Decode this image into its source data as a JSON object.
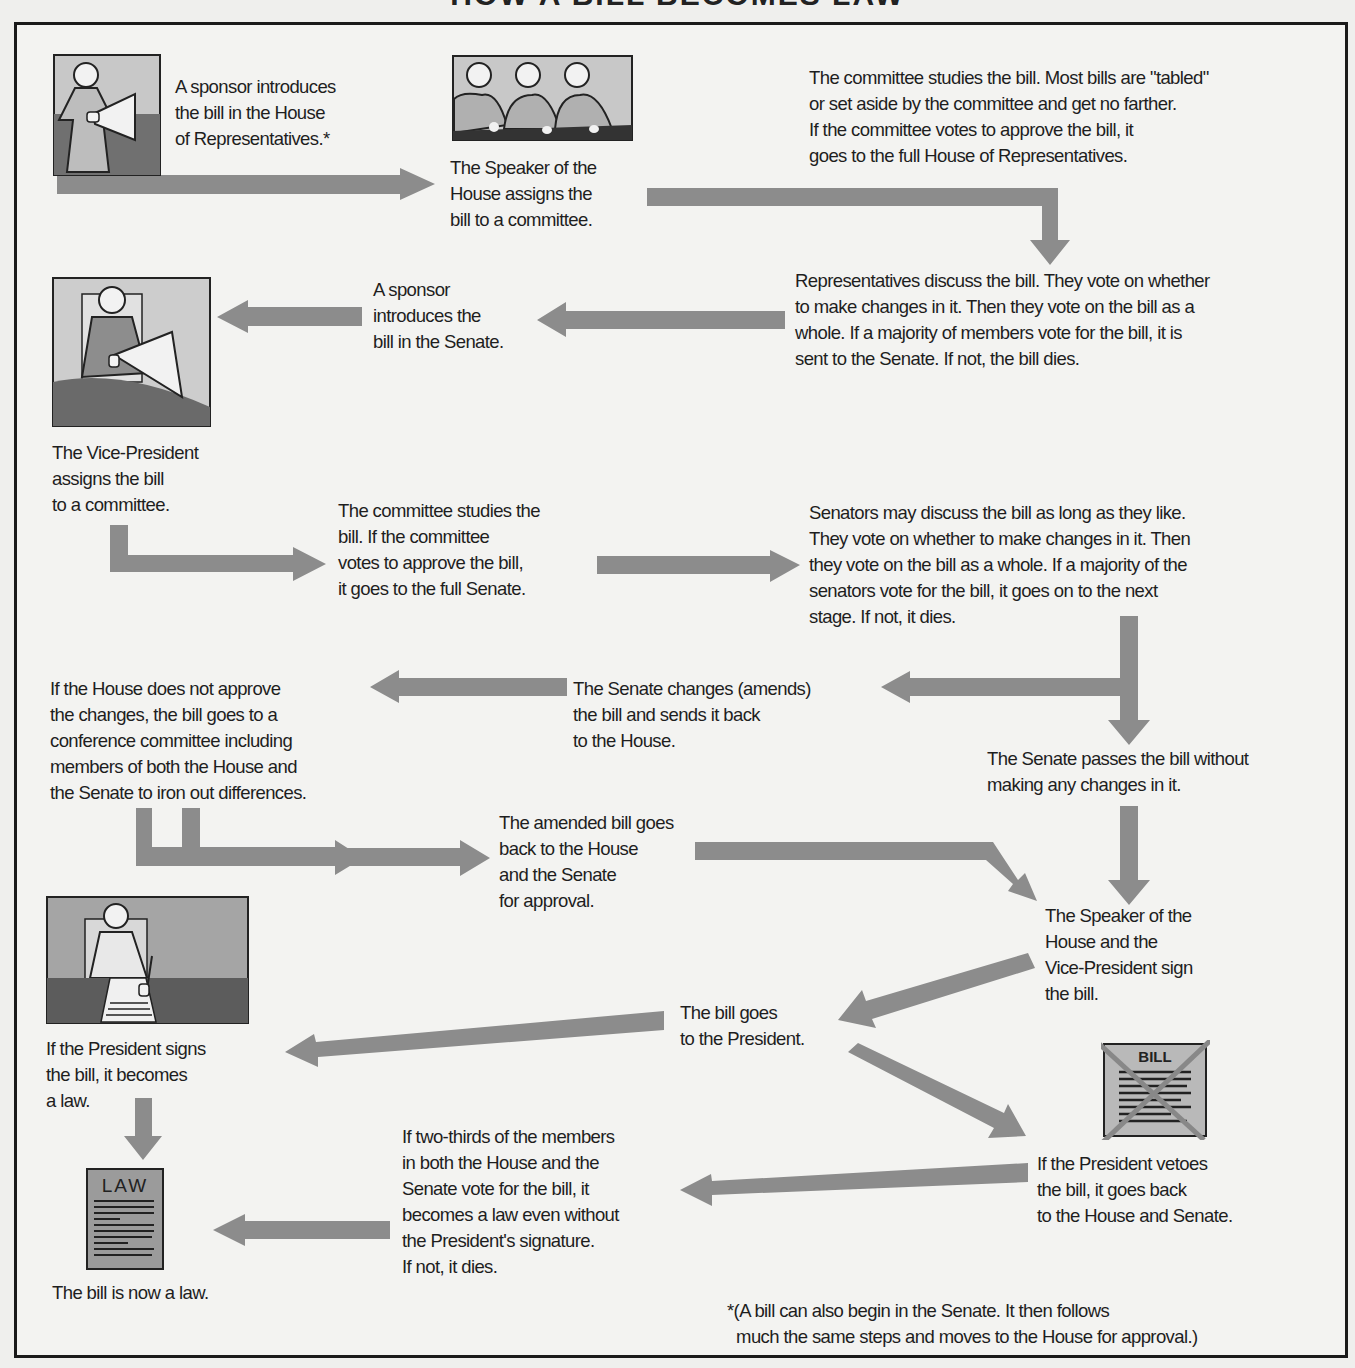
{
  "title": "HOW A BILL BECOMES LAW",
  "steps": {
    "house_sponsor": "A sponsor introduces\nthe bill in the House\nof Representatives.*",
    "speaker_assigns": "The Speaker of the\nHouse assigns the\nbill to a committee.",
    "house_committee": "The committee studies the bill. Most bills are \"tabled\"\nor set aside by the committee and get no farther.\nIf the committee votes to approve the bill, it\ngoes to the full House of Representatives.",
    "house_vote": "Representatives discuss the bill. They vote on whether\nto make changes in it. Then they vote on the bill as a\nwhole. If a majority of members vote for the bill, it is\nsent to the Senate. If not, the bill dies.",
    "senate_sponsor": "A sponsor\nintroduces the\nbill in the Senate.",
    "vp_assigns": "The Vice-President\nassigns the bill\nto a committee.",
    "senate_committee": "The committee studies the\nbill. If the committee\nvotes to approve the bill,\nit goes to the full Senate.",
    "senate_vote": "Senators may discuss the bill as long as they like.\nThey  vote on whether to make changes in it. Then\nthey   vote on the bill as a whole. If a majority of the\nsenators vote for the bill, it goes on to the next\nstage. If not, it dies.",
    "senate_amends": "The Senate changes (amends)\nthe bill  and sends it back\nto the House.",
    "conference": "If the House does not approve\nthe changes, the bill goes to a\nconference committee including\nmembers of both the House and\nthe Senate to iron out differences.",
    "senate_passes": "The Senate passes  the bill without\nmaking any changes in it.",
    "amended_back": "The amended bill goes\nback to the House\nand the Senate\nfor approval.",
    "leaders_sign": "The Speaker of the\nHouse and the\nVice-President sign\nthe bill.",
    "to_president": "The bill goes\nto the President.",
    "president_signs": "If the President signs\nthe bill, it becomes\na law.",
    "president_vetoes": "If the President  vetoes\nthe bill, it goes back\nto the House and Senate.",
    "override": "If two-thirds of the members\nin both the House and the\nSenate vote for the bill, it\nbecomes a law even without\nthe President's signature.\nIf not, it dies.",
    "now_law": "The bill is now a law."
  },
  "footnote": "*(A bill can also begin in the Senate. It then follows\n  much the same steps and moves to the House for approval.)",
  "icons": {
    "bill_label": "BILL",
    "law_label": "LAW"
  },
  "colors": {
    "arrow": "#8c8c8c",
    "frame": "#1a1a1a",
    "panel_light": "#c9c9c9",
    "panel_dark": "#6e6e6e"
  }
}
